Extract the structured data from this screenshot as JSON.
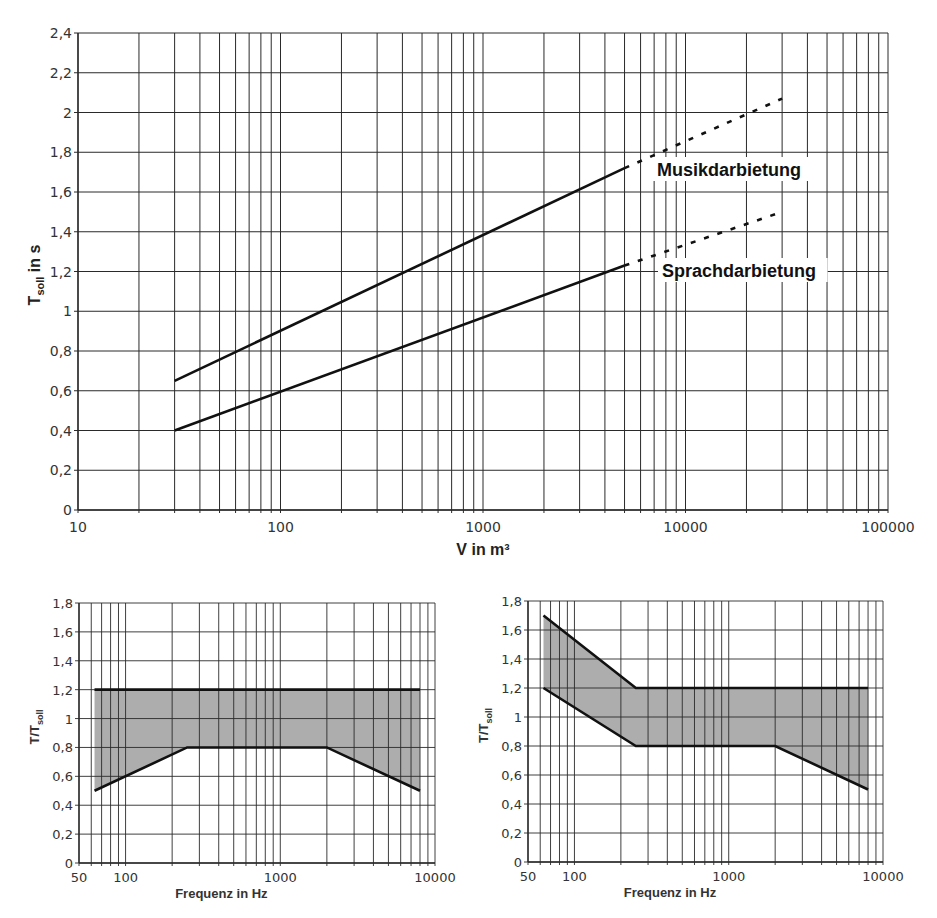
{
  "chart_data": [
    {
      "id": "main",
      "type": "line",
      "title": "",
      "xlabel": "V in m³",
      "ylabel": "T_soll in s",
      "ylabel_main": "T",
      "ylabel_sub": "soll",
      "ylabel_suffix": " in s",
      "xscale": "log",
      "xlim": [
        10,
        100000
      ],
      "ylim": [
        0,
        2.4
      ],
      "grid": true,
      "x_tick_labels": [
        "10",
        "100",
        "1000",
        "10000",
        "100000"
      ],
      "x_ticks": [
        10,
        100,
        1000,
        10000,
        100000
      ],
      "y_tick_labels": [
        "0",
        "0,2",
        "0,4",
        "0,6",
        "0,8",
        "1",
        "1,2",
        "1,4",
        "1,6",
        "1,8",
        "2",
        "2,2",
        "2,4"
      ],
      "y_ticks": [
        0,
        0.2,
        0.4,
        0.6,
        0.8,
        1.0,
        1.2,
        1.4,
        1.6,
        1.8,
        2.0,
        2.2,
        2.4
      ],
      "series": [
        {
          "name": "Musikdarbietung",
          "solid": {
            "x": [
              30,
              5000
            ],
            "y": [
              0.65,
              1.72
            ]
          },
          "dashed": {
            "x": [
              5000,
              30000
            ],
            "y": [
              1.72,
              2.07
            ]
          },
          "label_pos": {
            "x": 657,
            "y": 176
          }
        },
        {
          "name": "Sprachdarbietung",
          "solid": {
            "x": [
              30,
              5000
            ],
            "y": [
              0.4,
              1.23
            ]
          },
          "dashed": {
            "x": [
              5000,
              30000
            ],
            "y": [
              1.23,
              1.5
            ]
          },
          "label_pos": {
            "x": 662,
            "y": 277
          }
        }
      ],
      "legend": "inline labels"
    },
    {
      "id": "tolerance-music",
      "type": "area",
      "title": "",
      "xlabel": "Frequenz in Hz",
      "ylabel": "T/T_soll",
      "ylabel_main": "T/T",
      "ylabel_sub": "soll",
      "xscale": "log",
      "xlim": [
        50,
        10000
      ],
      "ylim": [
        0,
        1.8
      ],
      "grid": true,
      "x_tick_labels": [
        "50",
        "100",
        "1000",
        "10000"
      ],
      "x_ticks": [
        50,
        100,
        1000,
        10000
      ],
      "y_tick_labels": [
        "0",
        "0,2",
        "0,4",
        "0,6",
        "0,8",
        "1",
        "1,2",
        "1,4",
        "1,6",
        "1,8"
      ],
      "y_ticks": [
        0,
        0.2,
        0.4,
        0.6,
        0.8,
        1.0,
        1.2,
        1.4,
        1.6,
        1.8
      ],
      "series": [
        {
          "name": "upper limit",
          "x": [
            63,
            8000
          ],
          "y": [
            1.2,
            1.2
          ]
        },
        {
          "name": "lower limit",
          "x": [
            63,
            250,
            2000,
            8000
          ],
          "y": [
            0.5,
            0.8,
            0.8,
            0.5
          ]
        }
      ],
      "fill": "between upper and lower limit"
    },
    {
      "id": "tolerance-speech",
      "type": "area",
      "title": "",
      "xlabel": "Frequenz in Hz",
      "ylabel": "T/T_soll",
      "ylabel_main": "T/T",
      "ylabel_sub": "soll",
      "xscale": "log",
      "xlim": [
        50,
        10000
      ],
      "ylim": [
        0,
        1.8
      ],
      "grid": true,
      "x_tick_labels": [
        "50",
        "100",
        "1000",
        "10000"
      ],
      "x_ticks": [
        50,
        100,
        1000,
        10000
      ],
      "y_tick_labels": [
        "0",
        "0,2",
        "0,4",
        "0,6",
        "0,8",
        "1",
        "1,2",
        "1,4",
        "1,6",
        "1,8"
      ],
      "y_ticks": [
        0,
        0.2,
        0.4,
        0.6,
        0.8,
        1.0,
        1.2,
        1.4,
        1.6,
        1.8
      ],
      "series": [
        {
          "name": "upper limit",
          "x": [
            63,
            250,
            8000
          ],
          "y": [
            1.7,
            1.2,
            1.2
          ]
        },
        {
          "name": "lower limit",
          "x": [
            63,
            250,
            2000,
            8000
          ],
          "y": [
            1.2,
            0.8,
            0.8,
            0.5
          ]
        }
      ],
      "fill": "between upper and lower limit"
    }
  ],
  "colors": {
    "line": "#111111",
    "grid": "#2a2a2a",
    "fill": "#a9a9a9",
    "text": "#333333"
  }
}
